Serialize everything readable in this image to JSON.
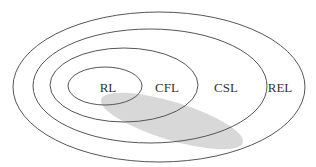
{
  "diagram": {
    "type": "nested-sets",
    "colors": {
      "stroke": "#555555",
      "shade": "#d8d8d8",
      "text": "#333333",
      "background": "#ffffff"
    },
    "sets": [
      {
        "id": "rel",
        "label": "REL",
        "cx": 159,
        "cy": 87,
        "rx": 146,
        "ry": 75,
        "label_x": 280,
        "label_y": 92
      },
      {
        "id": "csl",
        "label": "CSL",
        "cx": 150,
        "cy": 86,
        "rx": 117,
        "ry": 57,
        "label_x": 226,
        "label_y": 92
      },
      {
        "id": "cfl",
        "label": "CFL",
        "cx": 124,
        "cy": 85,
        "rx": 74,
        "ry": 37,
        "label_x": 167,
        "label_y": 92
      },
      {
        "id": "rl",
        "label": "RL",
        "cx": 105,
        "cy": 86,
        "rx": 37,
        "ry": 19,
        "label_x": 108,
        "label_y": 92
      }
    ],
    "shaded_region": {
      "cx": 172,
      "cy": 121,
      "rx": 74,
      "ry": 19,
      "rotate": 17
    }
  }
}
